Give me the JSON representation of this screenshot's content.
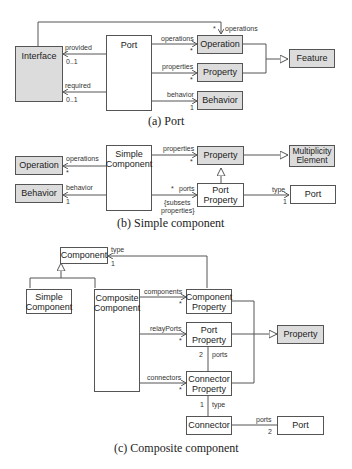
{
  "diagrams": {
    "port": {
      "caption": "(a) Port",
      "classes": {
        "interface": "Interface",
        "port": "Port",
        "operation": "Operation",
        "property": "Property",
        "behavior": "Behavior",
        "feature": "Feature"
      },
      "labels": {
        "top_operations": "operations",
        "top_operations_mult": "*",
        "provided": "provided",
        "provided_mult": "0..1",
        "required": "required",
        "required_mult": "0..1",
        "operations": "operations",
        "operations_mult": "*",
        "properties": "properties",
        "properties_mult": "*",
        "behavior": "behavior",
        "behavior_mult": "1"
      }
    },
    "simple_component": {
      "caption": "(b) Simple component",
      "classes": {
        "operation": "Operation",
        "behavior": "Behavior",
        "simple_component": "Simple Component",
        "property": "Property",
        "multiplicity_element": "Multiplicity Element",
        "port_property": "Port Property",
        "port": "Port"
      },
      "labels": {
        "operations": "operations",
        "operations_mult": "*",
        "behavior": "behavior",
        "behavior_mult": "1",
        "properties": "properties",
        "properties_mult": "*",
        "ports": "ports",
        "ports_mult": "*",
        "subsets_line1": "{subsets",
        "subsets_line2": "properties}",
        "type": "type",
        "type_mult": "1"
      }
    },
    "composite_component": {
      "caption": "(c) Composite component",
      "classes": {
        "component": "Component",
        "simple_component": "Simple Component",
        "composite_component": "Composite Component",
        "component_property": "Component Property",
        "port_property": "Port Property",
        "connector_property": "Connector Property",
        "property": "Property",
        "connector": "Connector",
        "port": "Port"
      },
      "labels": {
        "type_top": "type",
        "type_top_mult": "1",
        "components": "components",
        "components_mult": "*",
        "relayPorts": "relayPorts",
        "relayPorts_mult": "*",
        "connectors": "connectors",
        "connectors_mult": "*",
        "ports_mid": "ports",
        "ports_mid_mult": "2",
        "type_bottom": "type",
        "type_bottom_mult": "1",
        "ports_bottom": "ports",
        "ports_bottom_mult": "2"
      }
    }
  },
  "colors": {
    "shaded_fill": "#dcdcdc",
    "line": "#555555"
  }
}
